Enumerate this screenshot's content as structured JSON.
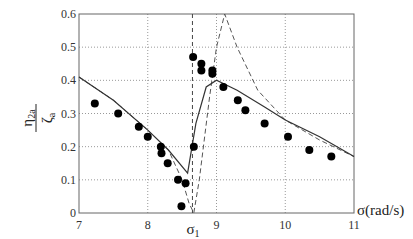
{
  "chart_data": {
    "type": "line",
    "title": "",
    "xlabel": "σ(rad/s)",
    "ylabel": "η2a / ζa",
    "ylabel_num": "η",
    "ylabel_num_sub": "2a",
    "ylabel_den": "ζ",
    "ylabel_den_sub": "a",
    "xlim": [
      7,
      11
    ],
    "ylim": [
      0,
      0.6
    ],
    "x_ticks": [
      "7",
      "8",
      "9",
      "10",
      "11"
    ],
    "y_ticks": [
      "0",
      "0.1",
      "0.2",
      "0.3",
      "0.4",
      "0.5",
      "0.6"
    ],
    "grid": true,
    "annotation": {
      "label": "σ",
      "sub": "1",
      "x": 8.65
    },
    "series": [
      {
        "name": "solid",
        "style": "solid",
        "x": [
          7.0,
          7.5,
          8.0,
          8.3,
          8.58,
          8.7,
          8.85,
          9.0,
          9.3,
          9.7,
          10.0,
          10.5,
          11.0
        ],
        "y": [
          0.41,
          0.34,
          0.25,
          0.19,
          0.12,
          0.27,
          0.38,
          0.4,
          0.37,
          0.32,
          0.28,
          0.23,
          0.17
        ]
      },
      {
        "name": "dashed",
        "style": "dashed",
        "x": [
          7.0,
          7.5,
          8.0,
          8.3,
          8.5,
          8.6,
          8.67,
          8.75,
          8.9,
          9.0,
          9.12,
          9.3,
          9.6,
          10.0,
          10.5,
          11.0
        ],
        "y": [
          0.41,
          0.34,
          0.25,
          0.19,
          0.1,
          0.03,
          0.0,
          0.1,
          0.35,
          0.5,
          0.6,
          0.5,
          0.37,
          0.28,
          0.22,
          0.17
        ]
      },
      {
        "name": "experiment",
        "style": "markers",
        "x": [
          7.23,
          7.57,
          7.87,
          8.0,
          8.19,
          8.2,
          8.29,
          8.44,
          8.55,
          8.49,
          8.67,
          8.66,
          8.78,
          8.78,
          8.94,
          8.94,
          9.1,
          9.31,
          9.42,
          9.7,
          10.04,
          10.35,
          10.67
        ],
        "y": [
          0.33,
          0.3,
          0.26,
          0.23,
          0.2,
          0.18,
          0.15,
          0.1,
          0.09,
          0.02,
          0.2,
          0.47,
          0.45,
          0.43,
          0.43,
          0.42,
          0.38,
          0.34,
          0.31,
          0.27,
          0.23,
          0.19,
          0.17
        ]
      }
    ]
  }
}
